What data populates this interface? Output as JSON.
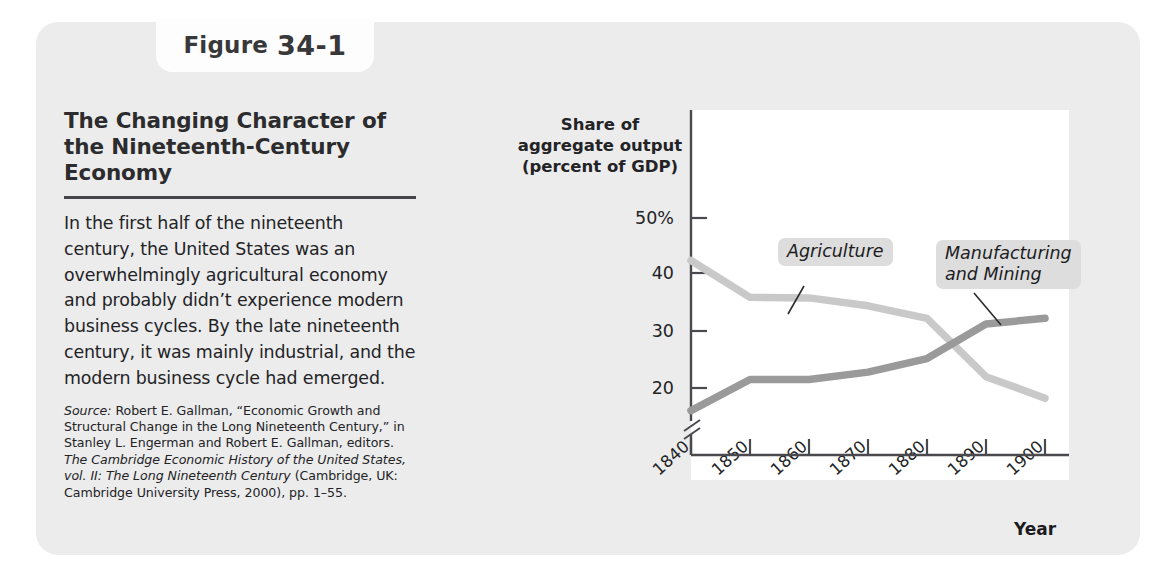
{
  "figure": {
    "tab_word": "Figure",
    "tab_number": "34-1",
    "title": "The Changing Character of the Nineteenth-Century Economy",
    "body": "In the first half of the nineteenth century, the United States was an overwhelmingly agricultural economy and probably didn’t experience modern business cycles. By the late nineteenth century, it was mainly industrial, and the modern business cycle had emerged.",
    "source_label": "Source:",
    "source_part1": " Robert E. Gallman, “Economic Growth and Structural Change in the Long Nineteenth Century,” in Stanley L. Engerman and Robert E. Gallman, editors. ",
    "source_italic": "The Cambridge Economic History of the United States, vol. II: The Long Nineteenth Century",
    "source_part2": " (Cambridge, UK: Cambridge University Press, 2000), pp. 1–55."
  },
  "chart_data": {
    "type": "line",
    "title": "The Changing Character of the Nineteenth-Century Economy",
    "xlabel": "Year",
    "ylabel": "Share of aggregate output (percent of GDP)",
    "x": [
      1840,
      1850,
      1860,
      1870,
      1880,
      1890,
      1900
    ],
    "xticklabels": [
      "1840",
      "1850",
      "1860",
      "1870",
      "1880",
      "1890",
      "1900"
    ],
    "yticklabels": [
      "50%",
      "40",
      "30",
      "20"
    ],
    "yticks": [
      50,
      40,
      30,
      20
    ],
    "ylim": [
      14,
      50
    ],
    "xlim": [
      1840,
      1900
    ],
    "axis_break": true,
    "grid": false,
    "legend": "inline-callouts",
    "series": [
      {
        "name": "Agriculture",
        "label": "Agriculture",
        "color": "#c9c9c9",
        "values": [
          42.5,
          36.0,
          35.9,
          34.5,
          32.3,
          22.0,
          18.2
        ]
      },
      {
        "name": "Manufacturing and Mining",
        "label": "Manufacturing\nand Mining",
        "color": "#9a9a9a",
        "values": [
          16.0,
          21.5,
          21.5,
          22.8,
          25.2,
          31.3,
          32.3
        ]
      }
    ]
  },
  "colors": {
    "card_background": "#ececed",
    "plot_background": "#ffffff",
    "axis": "#4a4a4e",
    "agriculture_line": "#c9c9c9",
    "manufacturing_line": "#9a9a9a",
    "callout_background": "#dddddd",
    "text": "#232325"
  }
}
